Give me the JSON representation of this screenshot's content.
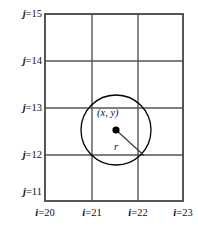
{
  "figure": {
    "type": "grid-circle-diagram",
    "background_color": "#ffffff",
    "grid_line_color": "#555555",
    "border_color": "#444444",
    "circle_color": "#000000",
    "point_color": "#000000",
    "text_color": "#111111"
  },
  "j_axis": {
    "name": "j",
    "labels": [
      {
        "text": "j=15",
        "var": "j",
        "eq": "=15",
        "value": 15,
        "y": 14
      },
      {
        "text": "j=14",
        "var": "j",
        "eq": "=14",
        "value": 14,
        "y": 61
      },
      {
        "text": "j=13",
        "var": "j",
        "eq": "=13",
        "value": 13,
        "y": 108
      },
      {
        "text": "j=12",
        "var": "j",
        "eq": "=12",
        "value": 12,
        "y": 155
      },
      {
        "text": "j=11",
        "var": "j",
        "eq": "=11",
        "value": 11,
        "y": 201
      }
    ]
  },
  "i_axis": {
    "name": "i",
    "labels": [
      {
        "text": "i=20",
        "var": "i",
        "eq": "=20",
        "value": 20,
        "x": 45
      },
      {
        "text": "i=21",
        "var": "i",
        "eq": "=21",
        "value": 21,
        "x": 92
      },
      {
        "text": "i=22",
        "var": "i",
        "eq": "=22",
        "value": 22,
        "x": 138
      },
      {
        "text": "i=23",
        "var": "i",
        "eq": "=23",
        "value": 23,
        "x": 183
      }
    ]
  },
  "grid": {
    "x_lines": [
      45,
      92,
      138,
      183
    ],
    "y_lines": [
      14,
      61,
      108,
      155,
      201
    ],
    "columns": 3,
    "rows": 4
  },
  "circle": {
    "center_x": 116,
    "center_y": 130,
    "radius": 35,
    "radius_label": "r",
    "radius_line_end_x": 144,
    "radius_line_end_y": 155.5
  },
  "center_point": {
    "label": "(x, y)",
    "dot_radius": 3.6,
    "label_x": 97,
    "label_y": 108
  }
}
